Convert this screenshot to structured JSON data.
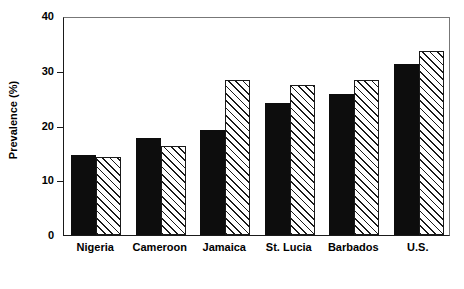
{
  "chart_data": {
    "type": "bar",
    "title": "",
    "xlabel": "",
    "ylabel": "Prevalence (%)",
    "categories": [
      "Nigeria",
      "Cameroon",
      "Jamaica",
      "St. Lucia",
      "Barbados",
      "U.S."
    ],
    "series": [
      {
        "name": "solid",
        "style": "solid-black",
        "color": "#0d0d0d",
        "values": [
          14.7,
          17.7,
          19.1,
          24.1,
          25.8,
          31.2
        ]
      },
      {
        "name": "hatched",
        "style": "diagonal-hatch",
        "color": "#1a1a1a",
        "values": [
          14.3,
          16.3,
          28.3,
          27.4,
          28.3,
          33.7
        ]
      }
    ],
    "ylim": [
      0,
      40
    ],
    "yticks": [
      0,
      10,
      20,
      30,
      40
    ],
    "ytick_labels": [
      "0",
      "10",
      "20",
      "30",
      "40"
    ],
    "grid": false,
    "legend": "none",
    "legend_position": "none"
  },
  "axes": {
    "y_title": "Prevalence (%)"
  }
}
